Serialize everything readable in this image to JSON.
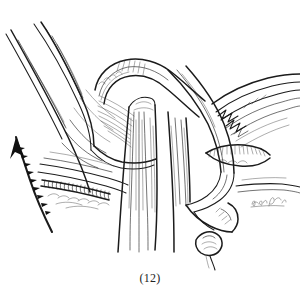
{
  "figure": {
    "caption": "(12)",
    "medium": "pen-and-ink line drawing",
    "background_color": "#ffffff",
    "ink_color": "#1b1b1b",
    "hatch_color": "#3a3a3a",
    "signature_color": "#555555",
    "signature_text": "artist signature",
    "width": 300,
    "height": 291
  },
  "annotations": {
    "direction_arrow": {
      "name": "traction-arrow",
      "label": "",
      "description": "curved barbed arrow pointing up and to the left",
      "tip_x": 16,
      "tip_y": 137,
      "tail_x": 52,
      "tail_y": 232
    }
  },
  "structures": [
    {
      "id": "upper-left-flap",
      "label": "",
      "region": "upper left"
    },
    {
      "id": "central-loop-band",
      "label": "",
      "region": "upper center"
    },
    {
      "id": "vertical-fiber-bundle",
      "label": "",
      "region": "center"
    },
    {
      "id": "sutured-band",
      "label": "",
      "region": "mid left"
    },
    {
      "id": "cut-edge-crescent",
      "label": "",
      "region": "mid right"
    },
    {
      "id": "right-fibrous-mass",
      "label": "",
      "region": "upper right"
    },
    {
      "id": "lower-right-fold",
      "label": "",
      "region": "lower right"
    }
  ]
}
